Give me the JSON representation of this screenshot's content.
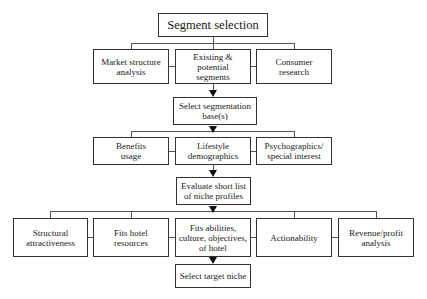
{
  "diagram": {
    "type": "flowchart",
    "title_node": "Segment selection",
    "level1": {
      "nodes": [
        "Market structure\nanalysis",
        "Existing &\npotential\nsegments",
        "Consumer\nresearch"
      ]
    },
    "step2": "Select segmentation\nbase(s)",
    "level2": {
      "nodes": [
        "Benefits\nusage",
        "Lifestyle\ndemographics",
        "Psychographics/\nspecial interest"
      ]
    },
    "step3": "Evaluate short list\nof niche profiles",
    "level3": {
      "nodes": [
        "Structural\nattractiveness",
        "Fits hotel\nresources",
        "Fits abilities,\nculture, objectives,\nof hotel",
        "Actionability",
        "Revenue/profit\nanalysis"
      ]
    },
    "final": "Select target niche",
    "colors": {
      "border": "#333333",
      "line": "#555555",
      "arrow": "#111111",
      "background": "#ffffff"
    }
  }
}
